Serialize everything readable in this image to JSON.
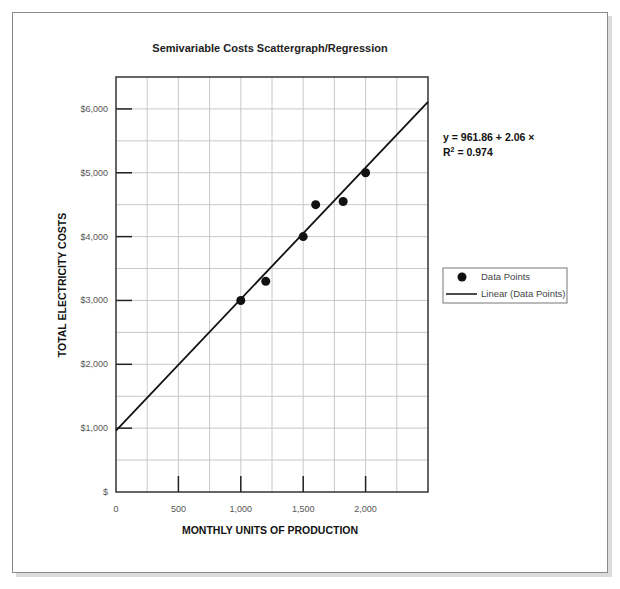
{
  "chart_data": {
    "type": "scatter",
    "title": "Semivariable Costs Scattergraph/Regression",
    "xlabel": "MONTHLY UNITS OF PRODUCTION",
    "ylabel": "TOTAL ELECTRICITY COSTS",
    "xlim": [
      0,
      2500
    ],
    "ylim": [
      0,
      6500
    ],
    "x_ticks": [
      0,
      500,
      1000,
      1500,
      2000
    ],
    "x_tick_labels": [
      "0",
      "500",
      "1,000",
      "1,500",
      "2,000"
    ],
    "y_ticks": [
      0,
      1000,
      2000,
      3000,
      4000,
      5000,
      6000
    ],
    "y_tick_labels": [
      "$",
      "$1,000",
      "$2,000",
      "$3,000",
      "$4,000",
      "$5,000",
      "$6,000"
    ],
    "x_gridlines": [
      250,
      500,
      750,
      1000,
      1250,
      1500,
      1750,
      2000,
      2250
    ],
    "y_gridlines": [
      500,
      1000,
      1500,
      2000,
      2500,
      3000,
      3500,
      4000,
      4500,
      5000,
      5500,
      6000
    ],
    "grid": true,
    "series": [
      {
        "name": "Data Points",
        "kind": "scatter",
        "points": [
          {
            "x": 1000,
            "y": 3000
          },
          {
            "x": 1200,
            "y": 3300
          },
          {
            "x": 1500,
            "y": 4000
          },
          {
            "x": 1600,
            "y": 4500
          },
          {
            "x": 1820,
            "y": 4550
          },
          {
            "x": 2000,
            "y": 5000
          }
        ]
      },
      {
        "name": "Linear (Data Points)",
        "kind": "line",
        "intercept": 961.86,
        "slope": 2.06
      }
    ],
    "annotations": {
      "equation": "y = 961.86 + 2.06 ×",
      "r_squared_prefix": "R",
      "r_squared_sup": "2",
      "r_squared_value": " = 0.974"
    },
    "legend": {
      "placement": "right",
      "entries": [
        "Data Points",
        "Linear (Data Points)"
      ]
    }
  }
}
